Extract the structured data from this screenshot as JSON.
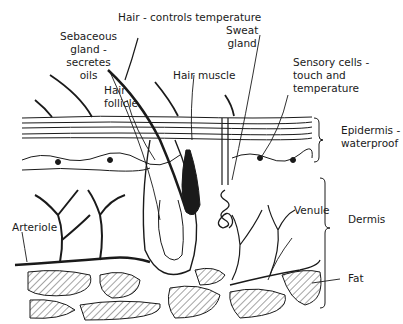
{
  "diagram": {
    "labels": {
      "hair": "Hair - controls temperature",
      "sebaceous": "Sebaceous\ngland -\nsecretes\noils",
      "hair_follicle": "Hair\nfollicle",
      "hair_muscle": "Hair muscle",
      "sweat_gland": "Sweat\ngland",
      "sensory_cells": "Sensory cells -\ntouch and\ntemperature",
      "epidermis": "Epidermis -\nwaterproof",
      "dermis": "Dermis",
      "arteriole": "Arteriole",
      "venule": "Venule",
      "fat": "Fat"
    },
    "layers": [
      "Epidermis",
      "Dermis",
      "Fat"
    ],
    "colors": {
      "ink": "#1a1a1a",
      "background": "#ffffff"
    }
  }
}
